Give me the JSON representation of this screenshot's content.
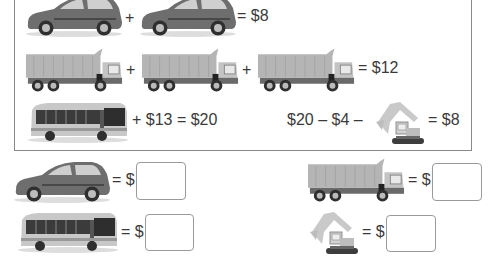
{
  "puzzle": {
    "equations": [
      {
        "id": "cars",
        "items": [
          "car",
          "car"
        ],
        "ops": [
          "+"
        ],
        "result_label": "= $8"
      },
      {
        "id": "trucks",
        "items": [
          "dump-truck",
          "dump-truck",
          "dump-truck"
        ],
        "ops": [
          "+",
          "+"
        ],
        "result_label": "= $12"
      },
      {
        "id": "bus",
        "items": [
          "bus"
        ],
        "suffix_label": "+ $13 = $20"
      },
      {
        "id": "excavator",
        "prefix_label": "$20 – $4 –",
        "items": [
          "excavator"
        ],
        "result_label": "= $8"
      }
    ],
    "plus": "+",
    "answers": {
      "car": {
        "label": "= $",
        "value": ""
      },
      "truck": {
        "label": "= $",
        "value": ""
      },
      "bus": {
        "label": "= $",
        "value": ""
      },
      "excavator": {
        "label": "= $",
        "value": ""
      }
    }
  },
  "colors": {
    "frame_border": "#8a8a8a",
    "car_body": "#6e6e6e",
    "truck_bed": "#b5b5b5",
    "text": "#3a3a3a"
  }
}
